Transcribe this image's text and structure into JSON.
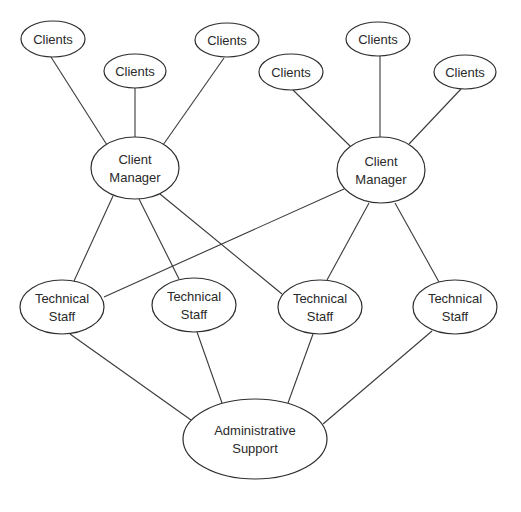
{
  "diagram": {
    "type": "organizational network",
    "nodes": [
      {
        "id": "c1",
        "lines": [
          "Clients"
        ],
        "cx": 53,
        "cy": 39,
        "rx": 32,
        "ry": 18
      },
      {
        "id": "c2",
        "lines": [
          "Clients"
        ],
        "cx": 135,
        "cy": 71,
        "rx": 31,
        "ry": 17
      },
      {
        "id": "c3",
        "lines": [
          "Clients"
        ],
        "cx": 227,
        "cy": 40,
        "rx": 32,
        "ry": 17
      },
      {
        "id": "c4",
        "lines": [
          "Clients"
        ],
        "cx": 291,
        "cy": 72,
        "rx": 32,
        "ry": 18
      },
      {
        "id": "c5",
        "lines": [
          "Clients"
        ],
        "cx": 378,
        "cy": 39,
        "rx": 32,
        "ry": 17
      },
      {
        "id": "c6",
        "lines": [
          "Clients"
        ],
        "cx": 465,
        "cy": 72,
        "rx": 31,
        "ry": 17
      },
      {
        "id": "cm1",
        "lines": [
          "Client",
          "Manager"
        ],
        "cx": 135,
        "cy": 168,
        "rx": 44,
        "ry": 31
      },
      {
        "id": "cm2",
        "lines": [
          "Client",
          "Manager"
        ],
        "cx": 381,
        "cy": 170,
        "rx": 44,
        "ry": 33
      },
      {
        "id": "t1",
        "lines": [
          "Technical",
          "Staff"
        ],
        "cx": 62,
        "cy": 307,
        "rx": 42,
        "ry": 27
      },
      {
        "id": "t2",
        "lines": [
          "Technical",
          "Staff"
        ],
        "cx": 194,
        "cy": 305,
        "rx": 42,
        "ry": 27
      },
      {
        "id": "t3",
        "lines": [
          "Technical",
          "Staff"
        ],
        "cx": 320,
        "cy": 307,
        "rx": 42,
        "ry": 27
      },
      {
        "id": "t4",
        "lines": [
          "Technical",
          "Staff"
        ],
        "cx": 455,
        "cy": 307,
        "rx": 42,
        "ry": 27
      },
      {
        "id": "admin",
        "lines": [
          "Administrative",
          "Support"
        ],
        "cx": 255,
        "cy": 439,
        "rx": 72,
        "ry": 40
      }
    ],
    "edges": [
      {
        "from": "c1",
        "to": "cm1",
        "x1": 51,
        "y1": 57,
        "x2": 107,
        "y2": 145
      },
      {
        "from": "c2",
        "to": "cm1",
        "x1": 135,
        "y1": 88,
        "x2": 135,
        "y2": 137
      },
      {
        "from": "c3",
        "to": "cm1",
        "x1": 224,
        "y1": 58,
        "x2": 163,
        "y2": 145
      },
      {
        "from": "c4",
        "to": "cm2",
        "x1": 293,
        "y1": 90,
        "x2": 350,
        "y2": 146
      },
      {
        "from": "c5",
        "to": "cm2",
        "x1": 380,
        "y1": 56,
        "x2": 380,
        "y2": 137
      },
      {
        "from": "c6",
        "to": "cm2",
        "x1": 461,
        "y1": 89,
        "x2": 409,
        "y2": 144
      },
      {
        "from": "cm1",
        "to": "t1",
        "x1": 113,
        "y1": 196,
        "x2": 74,
        "y2": 281
      },
      {
        "from": "cm1",
        "to": "t2",
        "x1": 139,
        "y1": 199,
        "x2": 179,
        "y2": 279
      },
      {
        "from": "cm1",
        "to": "t3",
        "x1": 160,
        "y1": 194,
        "x2": 282,
        "y2": 294
      },
      {
        "from": "cm2",
        "to": "t1",
        "x1": 344,
        "y1": 189,
        "x2": 104,
        "y2": 297
      },
      {
        "from": "cm2",
        "to": "t3",
        "x1": 369,
        "y1": 203,
        "x2": 327,
        "y2": 280
      },
      {
        "from": "cm2",
        "to": "t4",
        "x1": 395,
        "y1": 203,
        "x2": 439,
        "y2": 282
      },
      {
        "from": "t1",
        "to": "admin",
        "x1": 70,
        "y1": 334,
        "x2": 191,
        "y2": 420
      },
      {
        "from": "t2",
        "to": "admin",
        "x1": 197,
        "y1": 332,
        "x2": 222,
        "y2": 403
      },
      {
        "from": "t3",
        "to": "admin",
        "x1": 313,
        "y1": 334,
        "x2": 288,
        "y2": 403
      },
      {
        "from": "t4",
        "to": "admin",
        "x1": 432,
        "y1": 331,
        "x2": 323,
        "y2": 424
      }
    ]
  }
}
